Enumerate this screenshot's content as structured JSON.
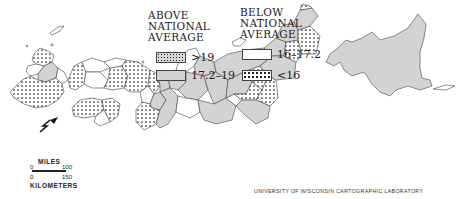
{
  "legend": {
    "above": {
      "heading": [
        "ABOVE",
        "NATIONAL",
        "AVERAGE"
      ],
      "items": [
        {
          "label": ">19",
          "pattern": "dense-dots-gray"
        },
        {
          "label": "17.2–19",
          "pattern": "solid-gray"
        }
      ]
    },
    "below": {
      "heading": [
        "BELOW",
        "NATIONAL",
        "AVERAGE"
      ],
      "items": [
        {
          "label": "16–17.2",
          "pattern": "white"
        },
        {
          "label": "<16",
          "pattern": "sparse-dots-white"
        }
      ]
    }
  },
  "scale": {
    "miles_label": "MILES",
    "miles_ticks": [
      "0",
      "100"
    ],
    "km_label": "KILOMETERS",
    "km_ticks": [
      "0",
      "150"
    ]
  },
  "north_arrow": "north-arrow-icon",
  "credit": "UNIVERSITY OF WISCONSIN CARTOGRAPHIC LABORATORY",
  "colors": {
    "gray_fill": "#d3d3d3",
    "outline": "#444444",
    "dots": "#222222"
  }
}
